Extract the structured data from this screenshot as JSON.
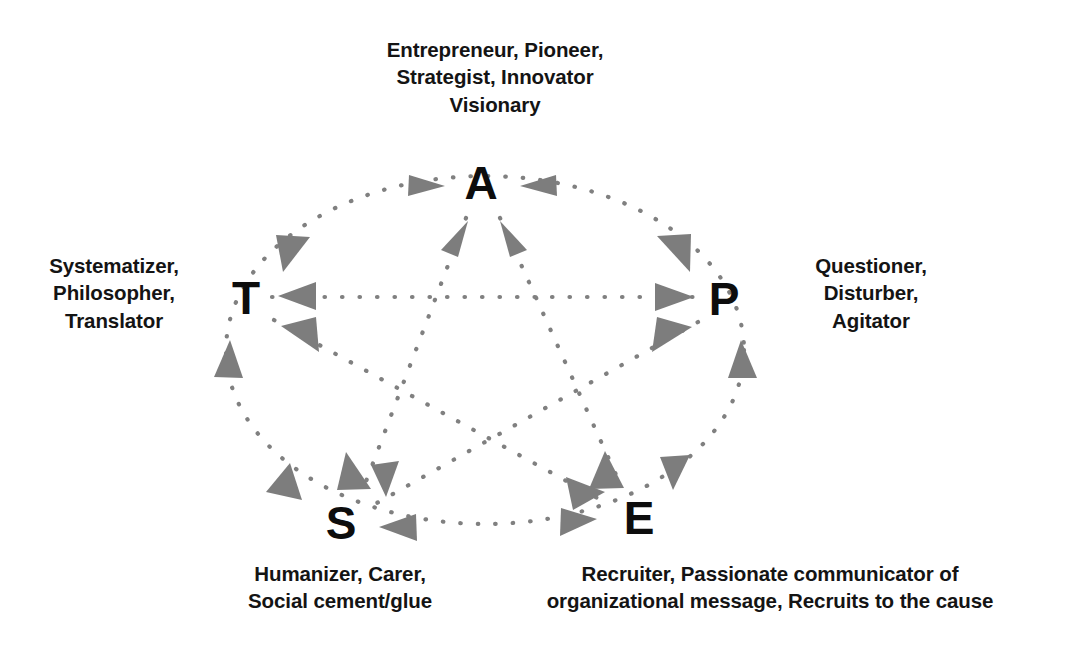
{
  "diagram": {
    "background_color": "#ffffff",
    "line_color": "#808080",
    "arrow_color": "#7d7d7d",
    "letter_color": "#0d0d0d",
    "nodes": [
      {
        "id": "A",
        "letter": "A",
        "cx": 481,
        "cy": 181,
        "label": "Entrepreneur, Pioneer,\nStrategist, Innovator\nVisionary"
      },
      {
        "id": "T",
        "letter": "T",
        "cx": 246,
        "cy": 296,
        "label": "Systematizer,\nPhilosopher,\nTranslator"
      },
      {
        "id": "P",
        "letter": "P",
        "cx": 724,
        "cy": 297,
        "label": "Questioner,\nDisturber,\nAgitator"
      },
      {
        "id": "S",
        "letter": "S",
        "cx": 341,
        "cy": 521,
        "label": "Humanizer, Carer,\nSocial cement/glue"
      },
      {
        "id": "E",
        "letter": "E",
        "cx": 639,
        "cy": 516,
        "label": "Recruiter, Passionate communicator of\norganizational message, Recruits to the cause"
      }
    ],
    "connections": [
      {
        "from": "A",
        "to": "T",
        "style": "dotted-arc",
        "bidirectional": true
      },
      {
        "from": "T",
        "to": "S",
        "style": "dotted-arc",
        "bidirectional": true
      },
      {
        "from": "S",
        "to": "E",
        "style": "dotted-arc",
        "bidirectional": true
      },
      {
        "from": "E",
        "to": "P",
        "style": "dotted-arc",
        "bidirectional": true
      },
      {
        "from": "P",
        "to": "A",
        "style": "dotted-arc",
        "bidirectional": true
      },
      {
        "from": "T",
        "to": "P",
        "style": "dotted-line",
        "bidirectional": true
      },
      {
        "from": "A",
        "to": "S",
        "style": "dotted-line",
        "bidirectional": true
      },
      {
        "from": "A",
        "to": "E",
        "style": "dotted-line",
        "bidirectional": true
      },
      {
        "from": "T",
        "to": "E",
        "style": "dotted-line",
        "bidirectional": true
      },
      {
        "from": "P",
        "to": "S",
        "style": "dotted-line",
        "bidirectional": true
      }
    ]
  }
}
